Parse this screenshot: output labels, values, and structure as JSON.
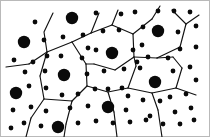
{
  "figure": {
    "width": 210,
    "height": 137,
    "background_color": "#ffffff",
    "frame_color": "#b9b9b9",
    "dot_color": "#0a0a0a",
    "edge_color": "#121212",
    "edge_width": 1.15,
    "large_dot_radius": 6.2,
    "small_dot_radius": 2.4
  },
  "chart_data": {
    "type": "scatter",
    "xlabel": "",
    "ylabel": "",
    "xlim": [
      0,
      210
    ],
    "ylim": [
      0,
      137
    ],
    "grid": false,
    "legend": "none",
    "series": [
      {
        "name": "large-dots",
        "marker_size": 6.2,
        "color": "#0a0a0a",
        "points": [
          [
            24,
            42
          ],
          [
            72,
            18
          ],
          [
            112,
            53
          ],
          [
            158,
            31
          ],
          [
            64,
            75
          ],
          [
            155,
            82
          ],
          [
            16,
            93
          ],
          [
            108,
            107
          ],
          [
            58,
            127
          ]
        ]
      },
      {
        "name": "small-dots",
        "marker_size": 2.4,
        "color": "#0a0a0a",
        "points": [
          [
            35,
            22
          ],
          [
            96,
            13
          ],
          [
            121,
            14
          ],
          [
            135,
            12
          ],
          [
            158,
            11
          ],
          [
            174,
            11
          ],
          [
            190,
            12
          ],
          [
            63,
            37
          ],
          [
            83,
            35
          ],
          [
            103,
            31
          ],
          [
            119,
            30
          ],
          [
            143,
            27
          ],
          [
            178,
            32
          ],
          [
            196,
            26
          ],
          [
            44,
            40
          ],
          [
            47,
            56
          ],
          [
            14,
            60
          ],
          [
            33,
            62
          ],
          [
            88,
            48
          ],
          [
            96,
            50
          ],
          [
            133,
            50
          ],
          [
            142,
            45
          ],
          [
            180,
            49
          ],
          [
            196,
            47
          ],
          [
            61,
            56
          ],
          [
            82,
            58
          ],
          [
            104,
            71
          ],
          [
            124,
            69
          ],
          [
            137,
            62
          ],
          [
            148,
            57
          ],
          [
            168,
            58
          ],
          [
            25,
            72
          ],
          [
            45,
            71
          ],
          [
            87,
            74
          ],
          [
            95,
            89
          ],
          [
            122,
            88
          ],
          [
            140,
            68
          ],
          [
            173,
            71
          ],
          [
            190,
            67
          ],
          [
            196,
            80
          ],
          [
            29,
            86
          ],
          [
            46,
            88
          ],
          [
            62,
            95
          ],
          [
            78,
            94
          ],
          [
            128,
            96
          ],
          [
            143,
            100
          ],
          [
            170,
            97
          ],
          [
            186,
            94
          ],
          [
            13,
            110
          ],
          [
            31,
            107
          ],
          [
            46,
            111
          ],
          [
            88,
            106
          ],
          [
            126,
            110
          ],
          [
            160,
            101
          ],
          [
            175,
            112
          ],
          [
            191,
            108
          ],
          [
            24,
            123
          ],
          [
            41,
            126
          ],
          [
            78,
            123
          ],
          [
            96,
            121
          ],
          [
            113,
            123
          ],
          [
            130,
            122
          ],
          [
            146,
            120
          ],
          [
            163,
            124
          ],
          [
            180,
            124
          ],
          [
            194,
            120
          ],
          [
            11,
            128
          ],
          [
            70,
            108
          ],
          [
            108,
            89
          ],
          [
            150,
            116
          ]
        ]
      }
    ],
    "cell_edges": [
      [
        [
          53,
          13
        ],
        [
          44,
          32
        ],
        [
          47,
          52
        ]
      ],
      [
        [
          47,
          52
        ],
        [
          29,
          64
        ]
      ],
      [
        [
          29,
          64
        ],
        [
          6,
          67
        ]
      ],
      [
        [
          47,
          52
        ],
        [
          40,
          76
        ]
      ],
      [
        [
          40,
          76
        ],
        [
          44,
          99
        ]
      ],
      [
        [
          44,
          99
        ],
        [
          31,
          118
        ]
      ],
      [
        [
          31,
          118
        ],
        [
          26,
          137
        ]
      ],
      [
        [
          44,
          99
        ],
        [
          72,
          101
        ]
      ],
      [
        [
          72,
          101
        ],
        [
          87,
          86
        ]
      ],
      [
        [
          87,
          86
        ],
        [
          86,
          64
        ]
      ],
      [
        [
          86,
          64
        ],
        [
          72,
          42
        ]
      ],
      [
        [
          72,
          42
        ],
        [
          47,
          52
        ]
      ],
      [
        [
          72,
          42
        ],
        [
          91,
          33
        ]
      ],
      [
        [
          91,
          33
        ],
        [
          99,
          13
        ]
      ],
      [
        [
          91,
          33
        ],
        [
          112,
          25
        ]
      ],
      [
        [
          112,
          25
        ],
        [
          133,
          34
        ]
      ],
      [
        [
          133,
          34
        ],
        [
          134,
          57
        ]
      ],
      [
        [
          134,
          57
        ],
        [
          115,
          70
        ]
      ],
      [
        [
          115,
          70
        ],
        [
          94,
          64
        ]
      ],
      [
        [
          94,
          64
        ],
        [
          86,
          64
        ]
      ],
      [
        [
          112,
          25
        ],
        [
          118,
          10
        ]
      ],
      [
        [
          133,
          34
        ],
        [
          152,
          19
        ]
      ],
      [
        [
          152,
          19
        ],
        [
          160,
          6
        ]
      ],
      [
        [
          134,
          57
        ],
        [
          157,
          58
        ]
      ],
      [
        [
          157,
          58
        ],
        [
          180,
          47
        ]
      ],
      [
        [
          180,
          47
        ],
        [
          186,
          24
        ]
      ],
      [
        [
          186,
          24
        ],
        [
          172,
          10
        ]
      ],
      [
        [
          87,
          86
        ],
        [
          108,
          92
        ]
      ],
      [
        [
          108,
          92
        ],
        [
          128,
          88
        ]
      ],
      [
        [
          128,
          88
        ],
        [
          136,
          66
        ]
      ],
      [
        [
          136,
          66
        ],
        [
          134,
          57
        ]
      ],
      [
        [
          128,
          88
        ],
        [
          152,
          93
        ]
      ],
      [
        [
          152,
          93
        ],
        [
          176,
          88
        ]
      ],
      [
        [
          176,
          88
        ],
        [
          182,
          68
        ]
      ],
      [
        [
          182,
          68
        ],
        [
          173,
          57
        ]
      ],
      [
        [
          173,
          57
        ],
        [
          157,
          58
        ]
      ],
      [
        [
          72,
          101
        ],
        [
          66,
          124
        ]
      ],
      [
        [
          66,
          124
        ],
        [
          64,
          137
        ]
      ],
      [
        [
          108,
          92
        ],
        [
          114,
          112
        ]
      ],
      [
        [
          114,
          112
        ],
        [
          117,
          137
        ]
      ],
      [
        [
          152,
          93
        ],
        [
          158,
          110
        ]
      ],
      [
        [
          158,
          110
        ],
        [
          162,
          137
        ]
      ],
      [
        [
          186,
          24
        ],
        [
          199,
          15
        ]
      ],
      [
        [
          176,
          88
        ],
        [
          196,
          95
        ]
      ]
    ]
  }
}
